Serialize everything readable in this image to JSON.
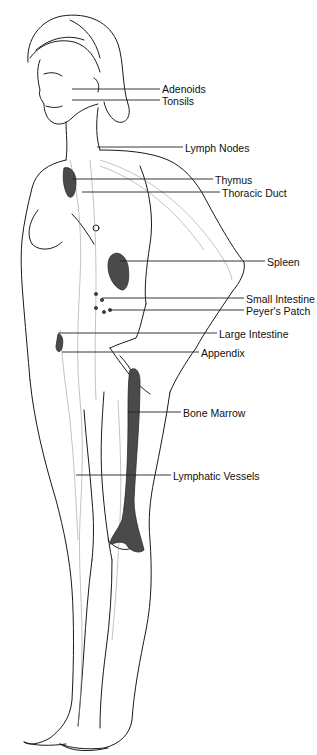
{
  "diagram": {
    "colors": {
      "ink": "#1a1a1a",
      "organ_fill": "#4a4a4a",
      "background": "#ffffff",
      "leader_line": "#222222"
    },
    "labels": [
      {
        "id": "adenoids",
        "text": "Adenoids",
        "x": 162,
        "y": 83,
        "line_from": 72,
        "line_y": 89
      },
      {
        "id": "tonsils",
        "text": "Tonsils",
        "x": 162,
        "y": 95,
        "line_from": 72,
        "line_y": 100
      },
      {
        "id": "lymph-nodes",
        "text": "Lymph Nodes",
        "x": 185,
        "y": 142,
        "line_from": 97,
        "line_y": 147
      },
      {
        "id": "thymus",
        "text": "Thymus",
        "x": 215,
        "y": 174,
        "line_from": 72,
        "line_y": 179
      },
      {
        "id": "thoracic-duct",
        "text": "Thoracic Duct",
        "x": 222,
        "y": 187,
        "line_from": 82,
        "line_y": 192
      },
      {
        "id": "spleen",
        "text": "Spleen",
        "x": 267,
        "y": 256,
        "line_from": 120,
        "line_y": 261
      },
      {
        "id": "small-intestine",
        "text": "Small Intestine",
        "x": 246,
        "y": 293,
        "line_from": 102,
        "line_y": 298
      },
      {
        "id": "peyers-patch",
        "text": "Peyer's Patch",
        "x": 246,
        "y": 305,
        "line_from": 110,
        "line_y": 310
      },
      {
        "id": "large-intestine",
        "text": "Large Intestine",
        "x": 219,
        "y": 328,
        "line_from": 58,
        "line_y": 333
      },
      {
        "id": "appendix",
        "text": "Appendix",
        "x": 201,
        "y": 347,
        "line_from": 62,
        "line_y": 352
      },
      {
        "id": "bone-marrow",
        "text": "Bone Marrow",
        "x": 183,
        "y": 407,
        "line_from": 128,
        "line_y": 412
      },
      {
        "id": "lymphatic-vessels",
        "text": "Lymphatic Vessels",
        "x": 173,
        "y": 470,
        "line_from": 76,
        "line_y": 475
      }
    ]
  }
}
